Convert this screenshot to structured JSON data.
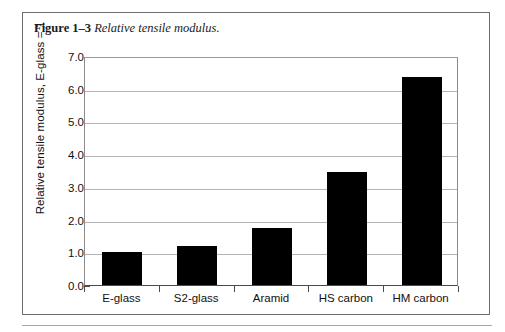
{
  "figure": {
    "label": "Figure 1–3",
    "title": "Relative tensile modulus."
  },
  "chart_data": {
    "type": "bar",
    "title": "Relative tensile modulus.",
    "categories": [
      "E-glass",
      "S2-glass",
      "Aramid",
      "HS carbon",
      "HM carbon"
    ],
    "values": [
      1.0,
      1.2,
      1.75,
      3.45,
      6.35
    ],
    "xlabel": "",
    "ylabel": "Relative tensile modulus, E-glass = 1",
    "ylim": [
      0.0,
      7.0
    ],
    "ytick_labels": [
      "0.0",
      "1.0",
      "2.0",
      "3.0",
      "4.0",
      "5.0",
      "6.0",
      "7.0"
    ],
    "ytick_values": [
      0.0,
      1.0,
      2.0,
      3.0,
      4.0,
      5.0,
      6.0,
      7.0
    ],
    "yminor_values": [
      0.5,
      1.5,
      2.5,
      3.5,
      4.5,
      5.5,
      6.5
    ],
    "grid": true,
    "legend": false,
    "bar_color": "#000000",
    "grid_color": "#b4b4b4",
    "axis_color": "#4a4a4a"
  }
}
